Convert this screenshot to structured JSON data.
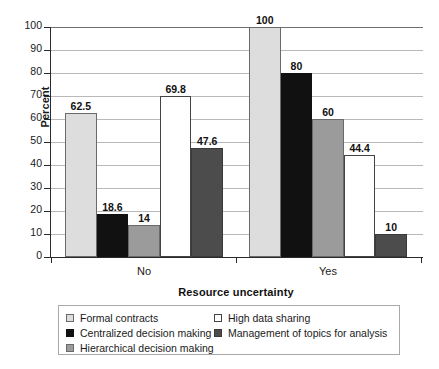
{
  "chart_data": {
    "type": "bar",
    "title": "",
    "subtitle": "",
    "xlabel": "Resource uncertainty",
    "ylabel": "Percent",
    "categories": [
      "No",
      "Yes"
    ],
    "ylim": [
      0,
      100
    ],
    "ytick_step": 10,
    "yticks": [
      0,
      10,
      20,
      30,
      40,
      50,
      60,
      70,
      80,
      90,
      100
    ],
    "ytick_labels": [
      "0",
      "10",
      "20",
      "30",
      "40",
      "50",
      "60",
      "70",
      "80",
      "90",
      "100"
    ],
    "grid": "horizontal",
    "legend_position": "bottom",
    "data_labels": true,
    "series": [
      {
        "name": "Formal contracts",
        "color": "#dddddd",
        "swatch": "light-gray",
        "values": [
          62.5,
          100
        ],
        "labels": [
          "62.5",
          "100"
        ]
      },
      {
        "name": "Centralized decision making",
        "color": "#111111",
        "swatch": "black",
        "values": [
          18.6,
          80
        ],
        "labels": [
          "18.6",
          "80"
        ]
      },
      {
        "name": "Hierarchical decision making",
        "color": "#9b9b9b",
        "swatch": "mid-gray",
        "values": [
          14,
          60
        ],
        "labels": [
          "14",
          "60"
        ]
      },
      {
        "name": "High data sharing",
        "color": "#ffffff",
        "swatch": "white",
        "values": [
          69.8,
          44.4
        ],
        "labels": [
          "69.8",
          "44.4"
        ]
      },
      {
        "name": "Management of topics for analysis",
        "color": "#4c4c4c",
        "swatch": "dark-gray",
        "values": [
          47.6,
          10
        ],
        "labels": [
          "47.6",
          "10"
        ]
      }
    ],
    "legend": {
      "column1": [
        "Formal contracts",
        "Centralized decision making",
        "Hierarchical decision making"
      ],
      "column2": [
        "High data sharing",
        "Management of topics for analysis"
      ]
    }
  }
}
